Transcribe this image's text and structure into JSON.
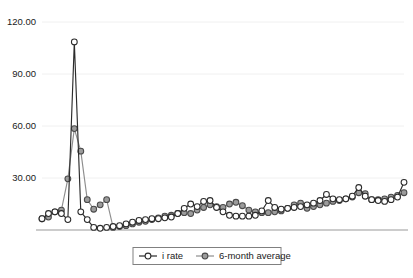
{
  "chart_data": {
    "type": "line",
    "title": "",
    "subtitle": "",
    "xlabel": "",
    "ylabel": "",
    "ylim": [
      0,
      120
    ],
    "xlim": [
      0,
      57
    ],
    "grid": true,
    "grid_axis": "y",
    "legend_position": "bottom-center",
    "y_ticks": [
      120,
      90,
      60,
      30
    ],
    "y_tick_labels": [
      "120.00",
      "90.00",
      "60.00",
      "30.00"
    ],
    "x_tick_labels": [],
    "x": [
      0,
      1,
      2,
      3,
      4,
      5,
      6,
      7,
      8,
      9,
      10,
      11,
      12,
      13,
      14,
      15,
      16,
      17,
      18,
      19,
      20,
      21,
      22,
      23,
      24,
      25,
      26,
      27,
      28,
      29,
      30,
      31,
      32,
      33,
      34,
      35,
      36,
      37,
      38,
      39,
      40,
      41,
      42,
      43,
      44,
      45,
      46,
      47,
      48,
      49,
      50,
      51,
      52,
      53,
      54,
      55,
      56
    ],
    "series": [
      {
        "name": "i rate",
        "marker": "open-circle",
        "color": "#2b2b2b",
        "marker_fill": "#ffffff",
        "values": [
          6.5,
          9.5,
          10.5,
          9.5,
          6.0,
          108.5,
          10.5,
          6.0,
          1.5,
          1.0,
          1.5,
          2.0,
          2.5,
          3.5,
          4.5,
          5.5,
          6.0,
          6.5,
          6.5,
          7.0,
          7.5,
          9.5,
          12.5,
          15.0,
          13.5,
          16.5,
          17.0,
          13.0,
          10.5,
          8.5,
          8.0,
          8.0,
          8.0,
          8.5,
          11.0,
          17.0,
          13.0,
          12.0,
          12.5,
          13.0,
          13.5,
          14.5,
          15.5,
          17.0,
          20.5,
          18.0,
          17.5,
          18.0,
          19.5,
          24.5,
          19.5,
          17.5,
          17.0,
          16.5,
          17.5,
          19.0,
          27.5
        ]
      },
      {
        "name": "6-month average",
        "marker": "filled-circle",
        "color": "#8e8e8e",
        "marker_fill": "#9c9c9c",
        "values": [
          6.5,
          7.5,
          10.5,
          11.5,
          29.5,
          58.5,
          45.5,
          17.5,
          12.0,
          14.5,
          17.5,
          1.5,
          2.0,
          2.5,
          3.5,
          4.5,
          5.0,
          6.0,
          7.0,
          8.0,
          8.5,
          9.5,
          10.0,
          9.5,
          11.5,
          13.0,
          14.5,
          13.5,
          13.0,
          15.0,
          16.0,
          14.0,
          11.5,
          10.5,
          10.0,
          10.0,
          10.5,
          11.0,
          12.5,
          14.5,
          15.5,
          12.5,
          13.5,
          14.5,
          15.5,
          16.5,
          17.0,
          18.0,
          19.0,
          21.5,
          21.0,
          17.5,
          17.5,
          18.0,
          19.0,
          20.0,
          21.5
        ]
      }
    ]
  },
  "legend": {
    "items": [
      {
        "label": "i rate"
      },
      {
        "label": "6-month average"
      }
    ]
  }
}
